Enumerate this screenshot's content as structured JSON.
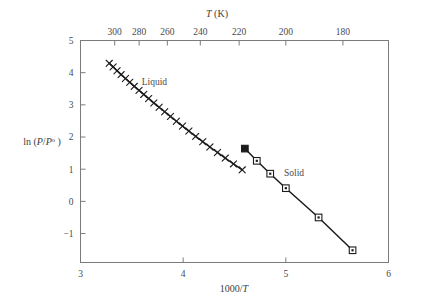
{
  "chart_data": {
    "type": "line",
    "title": "",
    "xlabel": "1000/T",
    "ylabel": "ln (P/P°)",
    "top_axis_label": "T (K)",
    "xlim": [
      3,
      6
    ],
    "ylim": [
      -1.9,
      5
    ],
    "grid": false,
    "legend": "none",
    "x_ticks": [
      "3",
      "4",
      "5",
      "6"
    ],
    "x_tick_values": [
      3,
      4,
      5,
      6
    ],
    "y_ticks": [
      "5",
      "4",
      "3",
      "2",
      "1",
      "0",
      "−1"
    ],
    "y_tick_values": [
      5,
      4,
      3,
      2,
      1,
      0,
      -1
    ],
    "top_ticks": [
      "300",
      "280",
      "260",
      "240",
      "220",
      "200",
      "180"
    ],
    "top_tick_temperatures": [
      300,
      280,
      260,
      240,
      220,
      200,
      180
    ],
    "top_tick_positions": [
      3.333,
      3.571,
      3.846,
      4.167,
      4.545,
      5.0,
      5.556
    ],
    "annotations": [
      {
        "text": "Liquid",
        "x": 3.72,
        "y": 3.62
      },
      {
        "text": "Solid",
        "x": 5.08,
        "y": 0.78
      }
    ],
    "series": [
      {
        "name": "Liquid",
        "marker": "x",
        "points": [
          [
            3.28,
            4.29
          ],
          [
            3.318,
            4.18
          ],
          [
            3.356,
            4.06
          ],
          [
            3.396,
            3.94
          ],
          [
            3.438,
            3.82
          ],
          [
            3.48,
            3.7
          ],
          [
            3.524,
            3.575
          ],
          [
            3.57,
            3.45
          ],
          [
            3.616,
            3.325
          ],
          [
            3.664,
            3.195
          ],
          [
            3.714,
            3.06
          ],
          [
            3.766,
            2.925
          ],
          [
            3.82,
            2.785
          ],
          [
            3.876,
            2.64
          ],
          [
            3.934,
            2.49
          ],
          [
            3.994,
            2.34
          ],
          [
            4.056,
            2.185
          ],
          [
            4.122,
            2.02
          ],
          [
            4.19,
            1.855
          ],
          [
            4.26,
            1.69
          ],
          [
            4.334,
            1.52
          ],
          [
            4.41,
            1.345
          ],
          [
            4.49,
            1.165
          ],
          [
            4.575,
            0.98
          ],
          [
            4.601,
            1.64
          ]
        ]
      },
      {
        "name": "Solid",
        "marker": "square",
        "points": [
          [
            4.601,
            1.64
          ],
          [
            4.717,
            1.26
          ],
          [
            4.848,
            0.86
          ],
          [
            5.0,
            0.41
          ],
          [
            5.319,
            -0.5
          ],
          [
            5.65,
            -1.52
          ]
        ]
      }
    ],
    "triple_point": {
      "x": 4.601,
      "y": 1.64,
      "marker": "filled-square"
    }
  }
}
